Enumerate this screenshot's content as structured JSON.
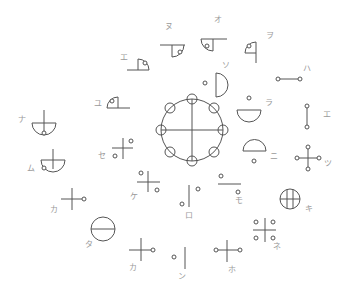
{
  "diagram": {
    "width": 349,
    "height": 295,
    "colors": {
      "line": "#555555",
      "label": "#9a9a9a",
      "background": "#ffffff"
    },
    "node_radius": 2,
    "center_wheel": {
      "name": "center-wheel",
      "shapes": [
        {
          "type": "circle",
          "cx": 192,
          "cy": 130,
          "r": 31
        },
        {
          "type": "line",
          "x1": 192,
          "y1": 99,
          "x2": 192,
          "y2": 161
        },
        {
          "type": "line",
          "x1": 161,
          "y1": 130,
          "x2": 223,
          "y2": 130
        },
        {
          "type": "ring",
          "cx": 192,
          "cy": 99,
          "r": 5
        },
        {
          "type": "ring",
          "cx": 192,
          "cy": 161,
          "r": 5
        },
        {
          "type": "ring",
          "cx": 161,
          "cy": 130,
          "r": 5
        },
        {
          "type": "ring",
          "cx": 223,
          "cy": 130,
          "r": 5
        },
        {
          "type": "ring",
          "cx": 170,
          "cy": 108,
          "r": 5
        },
        {
          "type": "ring",
          "cx": 214,
          "cy": 108,
          "r": 5
        },
        {
          "type": "ring",
          "cx": 170,
          "cy": 152,
          "r": 5
        },
        {
          "type": "ring",
          "cx": 214,
          "cy": 152,
          "r": 5
        }
      ]
    },
    "symbols": [
      {
        "name": "symbol-nu",
        "label": {
          "text": "ヌ",
          "x": 165,
          "y": 29
        },
        "shapes": [
          {
            "type": "line",
            "x1": 160,
            "y1": 45,
            "x2": 185,
            "y2": 45
          },
          {
            "type": "line",
            "x1": 172,
            "y1": 45,
            "x2": 172,
            "y2": 57
          },
          {
            "type": "path",
            "d": "M172,57 A12,12 0 0 0 184,45"
          },
          {
            "type": "node",
            "cx": 180,
            "cy": 52
          }
        ]
      },
      {
        "name": "symbol-o",
        "label": {
          "text": "オ",
          "x": 214,
          "y": 22
        },
        "shapes": [
          {
            "type": "line",
            "x1": 201,
            "y1": 39,
            "x2": 227,
            "y2": 39
          },
          {
            "type": "line",
            "x1": 213,
            "y1": 39,
            "x2": 213,
            "y2": 51
          },
          {
            "type": "path",
            "d": "M201,39 A12,12 0 0 0 213,51"
          },
          {
            "type": "node",
            "cx": 207,
            "cy": 46
          }
        ]
      },
      {
        "name": "symbol-wo",
        "label": {
          "text": "ヲ",
          "x": 266,
          "y": 38
        },
        "shapes": [
          {
            "type": "line",
            "x1": 256,
            "y1": 42,
            "x2": 256,
            "y2": 63
          },
          {
            "type": "line",
            "x1": 245,
            "y1": 53,
            "x2": 256,
            "y2": 53
          },
          {
            "type": "path",
            "d": "M256,42 A11,11 0 0 0 245,53"
          },
          {
            "type": "node",
            "cx": 249,
            "cy": 46
          }
        ]
      },
      {
        "name": "symbol-e-upper",
        "label": {
          "text": "エ",
          "x": 120,
          "y": 60
        },
        "shapes": [
          {
            "type": "line",
            "x1": 127,
            "y1": 70,
            "x2": 149,
            "y2": 70
          },
          {
            "type": "line",
            "x1": 138,
            "y1": 59,
            "x2": 138,
            "y2": 70
          },
          {
            "type": "path",
            "d": "M138,59 A11,11 0 0 1 149,70"
          },
          {
            "type": "node",
            "cx": 145,
            "cy": 63
          }
        ]
      },
      {
        "name": "symbol-yu",
        "label": {
          "text": "ユ",
          "x": 94,
          "y": 106
        },
        "shapes": [
          {
            "type": "line",
            "x1": 107,
            "y1": 108,
            "x2": 130,
            "y2": 108
          },
          {
            "type": "line",
            "x1": 118,
            "y1": 97,
            "x2": 118,
            "y2": 108
          },
          {
            "type": "path",
            "d": "M118,97 A11,11 0 0 0 107,108"
          },
          {
            "type": "node",
            "cx": 112,
            "cy": 101
          }
        ]
      },
      {
        "name": "symbol-so",
        "label": {
          "text": "ソ",
          "x": 222,
          "y": 68
        },
        "shapes": [
          {
            "type": "line",
            "x1": 216,
            "y1": 73,
            "x2": 216,
            "y2": 97
          },
          {
            "type": "path",
            "d": "M216,73 A12,12 0 0 1 216,97"
          },
          {
            "type": "node",
            "cx": 205,
            "cy": 83
          }
        ]
      },
      {
        "name": "symbol-ha",
        "label": {
          "text": "ハ",
          "x": 303,
          "y": 71
        },
        "shapes": [
          {
            "type": "line",
            "x1": 278,
            "y1": 79,
            "x2": 300,
            "y2": 79
          },
          {
            "type": "node",
            "cx": 278,
            "cy": 79
          },
          {
            "type": "node",
            "cx": 300,
            "cy": 79
          }
        ]
      },
      {
        "name": "symbol-ra",
        "label": {
          "text": "ラ",
          "x": 265,
          "y": 105
        },
        "shapes": [
          {
            "type": "line",
            "x1": 237,
            "y1": 110,
            "x2": 261,
            "y2": 110
          },
          {
            "type": "path",
            "d": "M237,110 A12,12 0 0 0 261,110"
          },
          {
            "type": "node",
            "cx": 249,
            "cy": 98
          }
        ]
      },
      {
        "name": "symbol-e-right",
        "label": {
          "text": "エ",
          "x": 323,
          "y": 117
        },
        "shapes": [
          {
            "type": "line",
            "x1": 307,
            "y1": 106,
            "x2": 307,
            "y2": 127
          },
          {
            "type": "node",
            "cx": 307,
            "cy": 106
          },
          {
            "type": "node",
            "cx": 307,
            "cy": 127
          }
        ]
      },
      {
        "name": "symbol-ni",
        "label": {
          "text": "ニ",
          "x": 270,
          "y": 159
        },
        "shapes": [
          {
            "type": "line",
            "x1": 243,
            "y1": 151,
            "x2": 266,
            "y2": 151
          },
          {
            "type": "path",
            "d": "M243,151 A11.5,11.5 0 0 1 266,151"
          },
          {
            "type": "node",
            "cx": 254,
            "cy": 161
          }
        ]
      },
      {
        "name": "symbol-tsu",
        "label": {
          "text": "ツ",
          "x": 324,
          "y": 166
        },
        "shapes": [
          {
            "type": "line",
            "x1": 308,
            "y1": 147,
            "x2": 308,
            "y2": 169
          },
          {
            "type": "line",
            "x1": 297,
            "y1": 158,
            "x2": 319,
            "y2": 158
          },
          {
            "type": "node",
            "cx": 308,
            "cy": 147
          },
          {
            "type": "node",
            "cx": 308,
            "cy": 169
          },
          {
            "type": "node",
            "cx": 297,
            "cy": 158
          },
          {
            "type": "node",
            "cx": 319,
            "cy": 158
          }
        ]
      },
      {
        "name": "symbol-na",
        "label": {
          "text": "ナ",
          "x": 18,
          "y": 122
        },
        "shapes": [
          {
            "type": "line",
            "x1": 44,
            "y1": 110,
            "x2": 44,
            "y2": 133
          },
          {
            "type": "line",
            "x1": 32,
            "y1": 123,
            "x2": 56,
            "y2": 123
          },
          {
            "type": "path",
            "d": "M32,123 A12,12 0 0 0 56,123"
          },
          {
            "type": "node",
            "cx": 44,
            "cy": 133
          }
        ]
      },
      {
        "name": "symbol-mu",
        "label": {
          "text": "ム",
          "x": 27,
          "y": 171
        },
        "shapes": [
          {
            "type": "line",
            "x1": 53,
            "y1": 149,
            "x2": 53,
            "y2": 169
          },
          {
            "type": "line",
            "x1": 41,
            "y1": 160,
            "x2": 65,
            "y2": 160
          },
          {
            "type": "path",
            "d": "M41,160 A12,12 0 0 0 65,160"
          },
          {
            "type": "node",
            "cx": 44,
            "cy": 168
          }
        ]
      },
      {
        "name": "symbol-se",
        "label": {
          "text": "セ",
          "x": 98,
          "y": 158
        },
        "shapes": [
          {
            "type": "line",
            "x1": 123,
            "y1": 138,
            "x2": 123,
            "y2": 159
          },
          {
            "type": "line",
            "x1": 112,
            "y1": 148,
            "x2": 133,
            "y2": 148
          },
          {
            "type": "node",
            "cx": 131,
            "cy": 141
          },
          {
            "type": "node",
            "cx": 115,
            "cy": 156
          }
        ]
      },
      {
        "name": "symbol-ke",
        "label": {
          "text": "ケ",
          "x": 130,
          "y": 199
        },
        "shapes": [
          {
            "type": "line",
            "x1": 148,
            "y1": 171,
            "x2": 148,
            "y2": 192
          },
          {
            "type": "line",
            "x1": 137,
            "y1": 182,
            "x2": 160,
            "y2": 182
          },
          {
            "type": "node",
            "cx": 141,
            "cy": 173
          },
          {
            "type": "node",
            "cx": 157,
            "cy": 190
          }
        ]
      },
      {
        "name": "symbol-ka-left",
        "label": {
          "text": "カ",
          "x": 50,
          "y": 212
        },
        "shapes": [
          {
            "type": "line",
            "x1": 72,
            "y1": 188,
            "x2": 72,
            "y2": 210
          },
          {
            "type": "line",
            "x1": 61,
            "y1": 199,
            "x2": 82,
            "y2": 199
          },
          {
            "type": "node",
            "cx": 84,
            "cy": 199
          }
        ]
      },
      {
        "name": "symbol-ta",
        "label": {
          "text": "タ",
          "x": 85,
          "y": 247
        },
        "shapes": [
          {
            "type": "circle",
            "cx": 103,
            "cy": 229,
            "r": 12
          },
          {
            "type": "line",
            "x1": 91,
            "y1": 229,
            "x2": 115,
            "y2": 229
          }
        ]
      },
      {
        "name": "symbol-ka-bottom",
        "label": {
          "text": "カ",
          "x": 129,
          "y": 270
        },
        "shapes": [
          {
            "type": "line",
            "x1": 141,
            "y1": 238,
            "x2": 141,
            "y2": 261
          },
          {
            "type": "line",
            "x1": 129,
            "y1": 250,
            "x2": 151,
            "y2": 250
          },
          {
            "type": "node",
            "cx": 153,
            "cy": 250
          }
        ]
      },
      {
        "name": "symbol-n",
        "label": {
          "text": "ン",
          "x": 178,
          "y": 279
        },
        "shapes": [
          {
            "type": "line",
            "x1": 185,
            "y1": 247,
            "x2": 185,
            "y2": 269
          },
          {
            "type": "node",
            "cx": 174,
            "cy": 257
          }
        ]
      },
      {
        "name": "symbol-ro",
        "label": {
          "text": "ロ",
          "x": 185,
          "y": 218
        },
        "shapes": [
          {
            "type": "line",
            "x1": 189,
            "y1": 185,
            "x2": 189,
            "y2": 207
          },
          {
            "type": "node",
            "cx": 198,
            "cy": 189
          },
          {
            "type": "node",
            "cx": 182,
            "cy": 204
          }
        ]
      },
      {
        "name": "symbol-mo",
        "label": {
          "text": "モ",
          "x": 235,
          "y": 203
        },
        "shapes": [
          {
            "type": "line",
            "x1": 218,
            "y1": 184,
            "x2": 241,
            "y2": 184
          },
          {
            "type": "node",
            "cx": 221,
            "cy": 176
          },
          {
            "type": "node",
            "cx": 238,
            "cy": 192
          }
        ]
      },
      {
        "name": "symbol-ho",
        "label": {
          "text": "ホ",
          "x": 228,
          "y": 272
        },
        "shapes": [
          {
            "type": "line",
            "x1": 227,
            "y1": 240,
            "x2": 227,
            "y2": 262
          },
          {
            "type": "line",
            "x1": 218,
            "y1": 250,
            "x2": 238,
            "y2": 250
          },
          {
            "type": "node",
            "cx": 216,
            "cy": 250
          },
          {
            "type": "node",
            "cx": 240,
            "cy": 250
          }
        ]
      },
      {
        "name": "symbol-ki",
        "label": {
          "text": "キ",
          "x": 305,
          "y": 211
        },
        "shapes": [
          {
            "type": "circle",
            "cx": 290,
            "cy": 199,
            "r": 10
          },
          {
            "type": "line",
            "x1": 287,
            "y1": 189.5,
            "x2": 287,
            "y2": 208.5
          },
          {
            "type": "line",
            "x1": 293,
            "y1": 189.5,
            "x2": 293,
            "y2": 208.5
          },
          {
            "type": "line",
            "x1": 280,
            "y1": 199,
            "x2": 300,
            "y2": 199
          }
        ]
      },
      {
        "name": "symbol-ne",
        "label": {
          "text": "ネ",
          "x": 273,
          "y": 249
        },
        "shapes": [
          {
            "type": "line",
            "x1": 265,
            "y1": 218,
            "x2": 265,
            "y2": 242
          },
          {
            "type": "line",
            "x1": 253,
            "y1": 230,
            "x2": 276,
            "y2": 230
          },
          {
            "type": "node",
            "cx": 256,
            "cy": 222
          },
          {
            "type": "node",
            "cx": 273,
            "cy": 222
          },
          {
            "type": "node",
            "cx": 256,
            "cy": 238
          },
          {
            "type": "node",
            "cx": 273,
            "cy": 238
          }
        ]
      }
    ]
  }
}
